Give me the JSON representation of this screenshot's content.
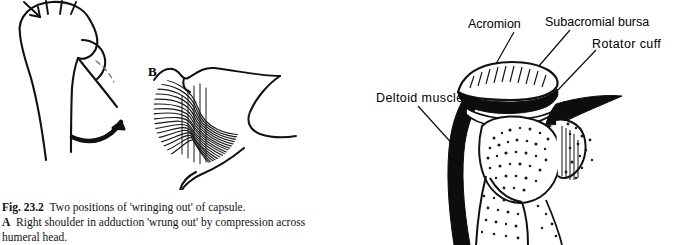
{
  "figure": {
    "number": "Fig. 23.2",
    "caption_title": "Two positions of 'wringing out' of capsule.",
    "part_a_letter": "A",
    "part_a_text": "Right shoulder in adduction 'wrung out' by compression across",
    "part_a_text_cont": "humeral head.",
    "part_b_letter": "B"
  },
  "labels": {
    "acromion": "Acromion",
    "subacromial_bursa": "Subacromial bursa",
    "rotator_cuff": "Rotator  cuff",
    "deltoid_muscle": "Deltoid  muscle"
  },
  "colors": {
    "ink": "#111111",
    "background": "#ffffff",
    "stipple": "#1a1a1a"
  }
}
